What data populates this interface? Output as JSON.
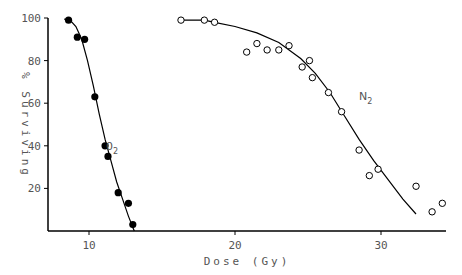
{
  "chart_data": {
    "type": "scatter",
    "title": "",
    "xlabel": "Dose (Gy)",
    "ylabel": "% Surviving",
    "xlim": [
      7.2,
      34.4
    ],
    "ylim": [
      0,
      100
    ],
    "xticks": [
      10,
      20,
      30
    ],
    "yticks": [
      20,
      40,
      60,
      80,
      100
    ],
    "grid": false,
    "legend": "inline labels",
    "series": [
      {
        "name": "O2",
        "label_main": "0",
        "label_sub": "2",
        "marker": "filled-circle",
        "color": "#000000",
        "points": [
          {
            "x": 8.6,
            "y": 99
          },
          {
            "x": 9.2,
            "y": 91
          },
          {
            "x": 9.7,
            "y": 90
          },
          {
            "x": 10.4,
            "y": 63
          },
          {
            "x": 11.1,
            "y": 40
          },
          {
            "x": 11.3,
            "y": 35
          },
          {
            "x": 12.0,
            "y": 18
          },
          {
            "x": 12.7,
            "y": 13
          },
          {
            "x": 13.0,
            "y": 3
          }
        ],
        "fit_curve": [
          {
            "x": 8.3,
            "y": 99.5
          },
          {
            "x": 8.7,
            "y": 99
          },
          {
            "x": 9.1,
            "y": 96
          },
          {
            "x": 9.5,
            "y": 90
          },
          {
            "x": 9.9,
            "y": 80
          },
          {
            "x": 10.3,
            "y": 68
          },
          {
            "x": 10.7,
            "y": 55
          },
          {
            "x": 11.1,
            "y": 43
          },
          {
            "x": 11.5,
            "y": 33
          },
          {
            "x": 11.9,
            "y": 23
          },
          {
            "x": 12.3,
            "y": 15
          },
          {
            "x": 12.7,
            "y": 7
          },
          {
            "x": 13.1,
            "y": 0
          }
        ]
      },
      {
        "name": "N2",
        "label_main": "N",
        "label_sub": "2",
        "marker": "open-circle",
        "color": "#000000",
        "points": [
          {
            "x": 16.3,
            "y": 99
          },
          {
            "x": 17.9,
            "y": 99
          },
          {
            "x": 18.6,
            "y": 98
          },
          {
            "x": 20.8,
            "y": 84
          },
          {
            "x": 21.5,
            "y": 88
          },
          {
            "x": 22.2,
            "y": 85
          },
          {
            "x": 23.0,
            "y": 85
          },
          {
            "x": 23.7,
            "y": 87
          },
          {
            "x": 24.6,
            "y": 77
          },
          {
            "x": 25.1,
            "y": 80
          },
          {
            "x": 25.3,
            "y": 72
          },
          {
            "x": 26.4,
            "y": 65
          },
          {
            "x": 27.3,
            "y": 56
          },
          {
            "x": 28.5,
            "y": 38
          },
          {
            "x": 29.2,
            "y": 26
          },
          {
            "x": 29.8,
            "y": 29
          },
          {
            "x": 32.4,
            "y": 21
          },
          {
            "x": 33.5,
            "y": 9
          },
          {
            "x": 34.2,
            "y": 13
          }
        ],
        "fit_curve": [
          {
            "x": 16.3,
            "y": 99
          },
          {
            "x": 17.9,
            "y": 99
          },
          {
            "x": 18.6,
            "y": 98
          },
          {
            "x": 20.0,
            "y": 96
          },
          {
            "x": 21.5,
            "y": 93
          },
          {
            "x": 23.0,
            "y": 88.5
          },
          {
            "x": 24.5,
            "y": 81
          },
          {
            "x": 25.5,
            "y": 74
          },
          {
            "x": 26.5,
            "y": 65
          },
          {
            "x": 27.5,
            "y": 54
          },
          {
            "x": 28.5,
            "y": 43
          },
          {
            "x": 29.5,
            "y": 33
          },
          {
            "x": 30.5,
            "y": 24
          },
          {
            "x": 31.5,
            "y": 15
          },
          {
            "x": 32.4,
            "y": 8
          }
        ]
      }
    ]
  },
  "axes": {
    "x_title": "Dose (Gy)",
    "y_title": "% Surviving",
    "x_tick_labels": [
      "10",
      "20",
      "30"
    ],
    "y_tick_labels": [
      "20",
      "40",
      "60",
      "80",
      "100"
    ]
  }
}
